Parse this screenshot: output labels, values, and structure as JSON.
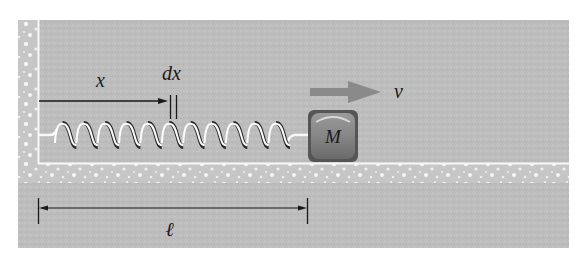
{
  "figure": {
    "labels": {
      "position": "x",
      "element": "dx",
      "velocity": "v",
      "mass": "M",
      "length": "ℓ"
    },
    "spring": {
      "coils": 11
    },
    "colors": {
      "background": "#ffffff",
      "panel": "#bcbcbc",
      "wall_texture": "#c4c4c4",
      "speckle": "#f4f4f4",
      "edge_line": "#f8f8f8",
      "mass_dark": "#5c5c5c",
      "mass_face": "#8c8c8c",
      "arrow": "#8a8a8a",
      "ink": "#1a1a1a"
    }
  }
}
